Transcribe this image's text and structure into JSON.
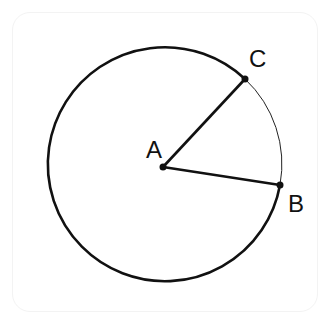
{
  "diagram": {
    "type": "circle-sector",
    "center": {
      "label": "A",
      "x": 163,
      "y": 167
    },
    "radius": 117,
    "points": [
      {
        "label": "B",
        "x": 280,
        "y": 185
      },
      {
        "label": "C",
        "x": 245,
        "y": 79
      }
    ],
    "segments": [
      "AB",
      "AC"
    ],
    "arcs": [
      {
        "from": "C",
        "to": "B",
        "style": "thin",
        "kind": "minor"
      },
      {
        "from": "B",
        "to": "C",
        "style": "thick",
        "kind": "major"
      }
    ],
    "colors": {
      "stroke": "#111111",
      "background": "#ffffff"
    }
  },
  "labels": {
    "a": "A",
    "b": "B",
    "c": "C"
  }
}
